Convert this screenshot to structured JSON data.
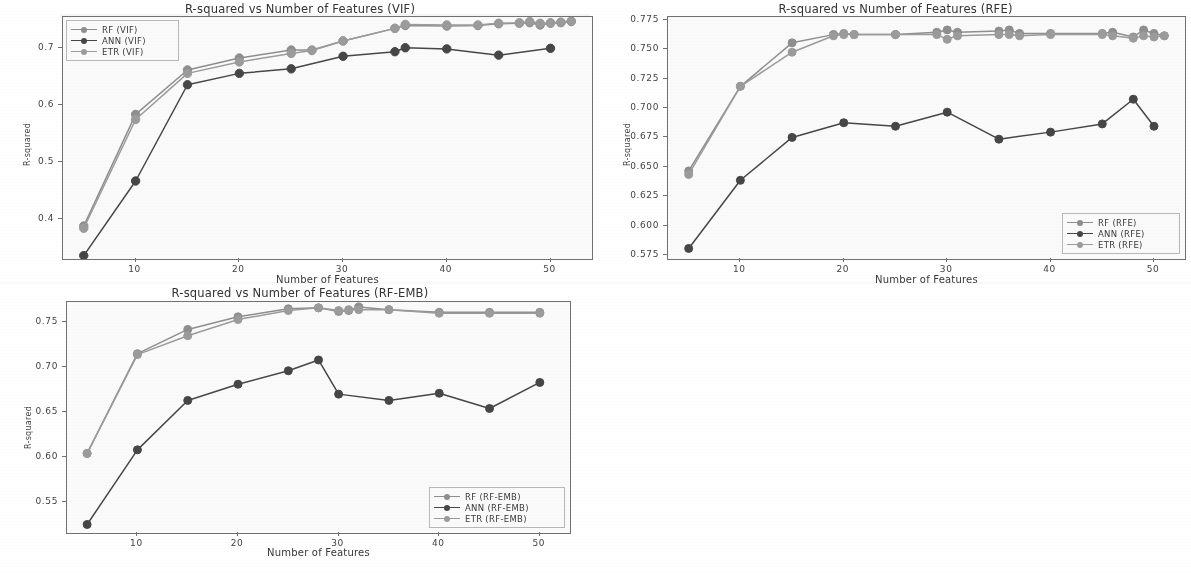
{
  "figure": {
    "axis_label_x": "Number of Features",
    "axis_label_y": "R-squared"
  },
  "colors": {
    "rf": "#8c8c8c",
    "ann": "#404040",
    "etr": "#9a9a9a",
    "axis": "#6d6d6d",
    "text": "#2f2f2f"
  },
  "panels": {
    "vif": {
      "title": "R-squared vs Number of Features (VIF)",
      "legend": [
        "RF (VIF)",
        "ANN (VIF)",
        "ETR (VIF)"
      ],
      "ytick_labels": [
        "0.4",
        "0.5",
        "0.6",
        "0.7"
      ],
      "xtick_labels": [
        "10",
        "20",
        "30",
        "40",
        "50"
      ]
    },
    "rfe": {
      "title": "R-squared vs Number of Features (RFE)",
      "legend": [
        "RF (RFE)",
        "ANN (RFE)",
        "ETR (RFE)"
      ],
      "ytick_labels": [
        "0.575",
        "0.600",
        "0.625",
        "0.650",
        "0.675",
        "0.700",
        "0.725",
        "0.750",
        "0.775"
      ],
      "xtick_labels": [
        "10",
        "20",
        "30",
        "40",
        "50"
      ]
    },
    "rfemb": {
      "title": "R-squared vs Number of Features (RF-EMB)",
      "legend": [
        "RF (RF-EMB)",
        "ANN (RF-EMB)",
        "ETR (RF-EMB)"
      ],
      "ytick_labels": [
        "0.55",
        "0.60",
        "0.65",
        "0.70",
        "0.75"
      ],
      "xtick_labels": [
        "10",
        "20",
        "30",
        "40",
        "50"
      ]
    }
  },
  "chart_data": [
    {
      "id": "vif",
      "type": "line",
      "title": "R-squared vs Number of Features (VIF)",
      "xlabel": "Number of Features",
      "ylabel": "R-squared",
      "xlim": [
        3,
        54
      ],
      "ylim": [
        0.33,
        0.755
      ],
      "yticks": [
        0.4,
        0.5,
        0.6,
        0.7
      ],
      "xticks": [
        10,
        20,
        30,
        40,
        50
      ],
      "grid": false,
      "legend_position": "upper-left",
      "series": [
        {
          "name": "RF (VIF)",
          "color": "#8c8c8c",
          "x": [
            5,
            10,
            15,
            20,
            25,
            27,
            30,
            35,
            36,
            40,
            43,
            45,
            47,
            48,
            49,
            50,
            51,
            52
          ],
          "y": [
            0.388,
            0.584,
            0.662,
            0.683,
            0.697,
            0.697,
            0.713,
            0.735,
            0.74,
            0.739,
            0.74,
            0.743,
            0.744,
            0.745,
            0.741,
            0.744,
            0.745,
            0.747
          ]
        },
        {
          "name": "ANN (VIF)",
          "color": "#404040",
          "x": [
            5,
            10,
            15,
            20,
            25,
            30,
            35,
            36,
            40,
            45,
            50
          ],
          "y": [
            0.336,
            0.467,
            0.636,
            0.656,
            0.664,
            0.686,
            0.694,
            0.701,
            0.699,
            0.688,
            0.7
          ]
        },
        {
          "name": "ETR (VIF)",
          "color": "#9a9a9a",
          "x": [
            5,
            10,
            15,
            20,
            25,
            27,
            30,
            35,
            36,
            40,
            43,
            45,
            47,
            48,
            49,
            50,
            51,
            52
          ],
          "y": [
            0.384,
            0.575,
            0.656,
            0.676,
            0.691,
            0.696,
            0.713,
            0.735,
            0.742,
            0.741,
            0.741,
            0.744,
            0.745,
            0.747,
            0.744,
            0.745,
            0.746,
            0.748
          ]
        }
      ]
    },
    {
      "id": "rfe",
      "type": "line",
      "title": "R-squared vs Number of Features (RFE)",
      "xlabel": "Number of Features",
      "ylabel": "R-squared",
      "xlim": [
        3,
        53
      ],
      "ylim": [
        0.5715,
        0.7775
      ],
      "yticks": [
        0.575,
        0.6,
        0.625,
        0.65,
        0.675,
        0.7,
        0.725,
        0.75,
        0.775
      ],
      "xticks": [
        10,
        20,
        30,
        40,
        50
      ],
      "grid": false,
      "legend_position": "lower-right",
      "series": [
        {
          "name": "RF (RFE)",
          "color": "#8c8c8c",
          "x": [
            5,
            10,
            15,
            19,
            20,
            21,
            25,
            29,
            30,
            31,
            35,
            36,
            37,
            40,
            45,
            46,
            48,
            49,
            50,
            51
          ],
          "y": [
            0.6465,
            0.7185,
            0.7555,
            0.7625,
            0.7635,
            0.7625,
            0.7625,
            0.7645,
            0.7665,
            0.7645,
            0.7655,
            0.7665,
            0.7635,
            0.7635,
            0.7635,
            0.7645,
            0.7605,
            0.7665,
            0.7635,
            0.7615
          ]
        },
        {
          "name": "ANN (RFE)",
          "color": "#404040",
          "x": [
            5,
            10,
            15,
            20,
            25,
            30,
            35,
            40,
            45,
            48,
            50
          ],
          "y": [
            0.5805,
            0.6385,
            0.675,
            0.6875,
            0.6845,
            0.6965,
            0.6735,
            0.6795,
            0.6865,
            0.7075,
            0.6845
          ]
        },
        {
          "name": "ETR (RFE)",
          "color": "#9a9a9a",
          "x": [
            5,
            10,
            15,
            19,
            20,
            21,
            25,
            29,
            30,
            31,
            35,
            36,
            37,
            40,
            45,
            46,
            48,
            49,
            50,
            51
          ],
          "y": [
            0.6435,
            0.7185,
            0.7475,
            0.7615,
            0.7625,
            0.7625,
            0.7625,
            0.7625,
            0.7585,
            0.7615,
            0.7625,
            0.7625,
            0.7615,
            0.7625,
            0.7625,
            0.7615,
            0.7595,
            0.7615,
            0.7605,
            0.7615
          ]
        }
      ]
    },
    {
      "id": "rfemb",
      "type": "line",
      "title": "R-squared vs Number of Features (RF-EMB)",
      "xlabel": "Number of Features",
      "ylabel": "R-squared",
      "xlim": [
        3,
        53
      ],
      "ylim": [
        0.515,
        0.772
      ],
      "yticks": [
        0.55,
        0.6,
        0.65,
        0.7,
        0.75
      ],
      "xticks": [
        10,
        20,
        30,
        40,
        50
      ],
      "grid": false,
      "legend_position": "lower-right",
      "series": [
        {
          "name": "RF (RF-EMB)",
          "color": "#8c8c8c",
          "x": [
            5,
            10,
            15,
            20,
            25,
            28,
            30,
            31,
            32,
            35,
            40,
            45,
            50
          ],
          "y": [
            0.6035,
            0.7145,
            0.7415,
            0.7555,
            0.7645,
            0.7655,
            0.7615,
            0.7625,
            0.7665,
            0.7635,
            0.7605,
            0.7605,
            0.7605
          ]
        },
        {
          "name": "ANN (RF-EMB)",
          "color": "#404040",
          "x": [
            5,
            10,
            15,
            20,
            25,
            28,
            30,
            35,
            40,
            45,
            50
          ],
          "y": [
            0.5245,
            0.6075,
            0.6625,
            0.6805,
            0.6955,
            0.7075,
            0.6695,
            0.6625,
            0.6705,
            0.6535,
            0.6825
          ]
        },
        {
          "name": "ETR (RF-EMB)",
          "color": "#9a9a9a",
          "x": [
            5,
            10,
            15,
            20,
            25,
            28,
            30,
            31,
            32,
            35,
            40,
            45,
            50
          ],
          "y": [
            0.6035,
            0.7135,
            0.7345,
            0.7525,
            0.7625,
            0.7655,
            0.7625,
            0.7635,
            0.7635,
            0.7635,
            0.7595,
            0.7595,
            0.7595
          ]
        }
      ]
    }
  ]
}
